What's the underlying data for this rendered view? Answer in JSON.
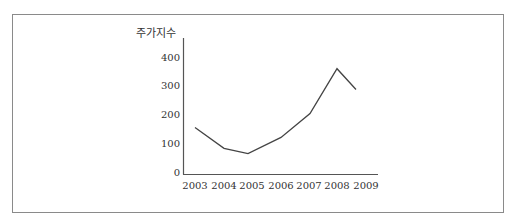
{
  "chart_data": {
    "type": "line",
    "title": "",
    "xlabel": "",
    "ylabel": "주가지수",
    "categories": [
      "2003",
      "2004",
      "2005",
      "2006",
      "2007",
      "2008",
      "2009"
    ],
    "values": [
      162,
      90,
      72,
      128,
      210,
      365,
      293
    ],
    "yticks": [
      "0",
      "100",
      "200",
      "300",
      "400"
    ],
    "ylim": [
      0,
      420
    ],
    "grid": false,
    "legend": null,
    "line_color": "#444444"
  }
}
